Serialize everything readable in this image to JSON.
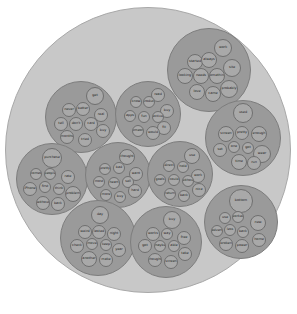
{
  "diagram": {
    "type": "circle-packing",
    "colors": {
      "background": "#ffffff",
      "outer": "#c8c8c8",
      "group": "#9a9a9a",
      "leaf": "#a9a9a9",
      "leaf_border": "#6f6f6f"
    },
    "outer": {
      "cx": 148,
      "cy": 150,
      "r": 143
    },
    "groups": [
      {
        "id": "g1",
        "cx": 209,
        "cy": 70,
        "r": 42,
        "leaves": [
          {
            "label": "work",
            "dx": 14,
            "dy": -22,
            "r": 9
          },
          {
            "label": "started",
            "dx": -14,
            "dy": -8,
            "r": 8
          },
          {
            "label": "always",
            "dx": 0,
            "dy": -10,
            "r": 8
          },
          {
            "label": "site",
            "dx": 23,
            "dy": -2,
            "r": 9
          },
          {
            "label": "looking",
            "dx": -24,
            "dy": 6,
            "r": 8
          },
          {
            "label": "needs",
            "dx": -8,
            "dy": 6,
            "r": 8
          },
          {
            "label": "something",
            "dx": 8,
            "dy": 6,
            "r": 8
          },
          {
            "label": "love",
            "dx": -12,
            "dy": 22,
            "r": 8
          },
          {
            "label": "came",
            "dx": 4,
            "dy": 24,
            "r": 8
          },
          {
            "label": "probably",
            "dx": 20,
            "dy": 19,
            "r": 9
          }
        ]
      },
      {
        "id": "g2",
        "cx": 81,
        "cy": 117,
        "r": 36,
        "leaves": [
          {
            "label": "get",
            "dx": 14,
            "dy": -21,
            "r": 9
          },
          {
            "label": "never",
            "dx": -12,
            "dy": -7,
            "r": 7
          },
          {
            "label": "better",
            "dx": 2,
            "dy": -8,
            "r": 7
          },
          {
            "label": "real",
            "dx": 20,
            "dy": -2,
            "r": 7
          },
          {
            "label": "tell",
            "dx": -20,
            "dy": 7,
            "r": 7
          },
          {
            "label": "don't",
            "dx": -5,
            "dy": 7,
            "r": 7
          },
          {
            "label": "card",
            "dx": 10,
            "dy": 7,
            "r": 7
          },
          {
            "label": "buy",
            "dx": 22,
            "dy": 14,
            "r": 7
          },
          {
            "label": "months",
            "dx": -14,
            "dy": 20,
            "r": 7
          },
          {
            "label": "tried",
            "dx": 4,
            "dy": 23,
            "r": 7
          }
        ]
      },
      {
        "id": "g3",
        "cx": 148,
        "cy": 114,
        "r": 33,
        "leaves": [
          {
            "label": "read",
            "dx": 10,
            "dy": -19,
            "r": 7
          },
          {
            "label": "know",
            "dx": -12,
            "dy": -12,
            "r": 6
          },
          {
            "label": "product",
            "dx": 1,
            "dy": -12,
            "r": 6
          },
          {
            "label": "buy",
            "dx": 19,
            "dy": -3,
            "r": 7
          },
          {
            "label": "apps",
            "dx": -18,
            "dy": 2,
            "r": 6
          },
          {
            "label": "fun",
            "dx": -4,
            "dy": 3,
            "r": 6
          },
          {
            "label": "active",
            "dx": 10,
            "dy": 3,
            "r": 6
          },
          {
            "label": "fit",
            "dx": 16,
            "dy": 14,
            "r": 7
          },
          {
            "label": "someone",
            "dx": -10,
            "dy": 17,
            "r": 6
          },
          {
            "label": "would",
            "dx": 5,
            "dy": 19,
            "r": 7
          }
        ]
      },
      {
        "id": "g4",
        "cx": 243,
        "cy": 138,
        "r": 38,
        "leaves": [
          {
            "label": "used",
            "dx": 0,
            "dy": -25,
            "r": 10
          },
          {
            "label": "screen",
            "dx": -17,
            "dy": -4,
            "r": 8
          },
          {
            "label": "pretty",
            "dx": -1,
            "dy": -5,
            "r": 7
          },
          {
            "label": "enough",
            "dx": 16,
            "dy": -4,
            "r": 8
          },
          {
            "label": "set",
            "dx": -23,
            "dy": 12,
            "r": 7
          },
          {
            "label": "one",
            "dx": -9,
            "dy": 9,
            "r": 6
          },
          {
            "label": "got",
            "dx": 5,
            "dy": 10,
            "r": 6
          },
          {
            "label": "wear",
            "dx": 19,
            "dy": 16,
            "r": 9
          },
          {
            "label": "time",
            "dx": -4,
            "dy": 24,
            "r": 8
          },
          {
            "label": "run",
            "dx": 11,
            "dy": 25,
            "r": 7
          }
        ]
      },
      {
        "id": "g5",
        "cx": 52,
        "cy": 179,
        "r": 36,
        "leaves": [
          {
            "label": "purchase",
            "dx": 0,
            "dy": -21,
            "r": 10
          },
          {
            "label": "comes",
            "dx": -16,
            "dy": -5,
            "r": 6
          },
          {
            "label": "people",
            "dx": -2,
            "dy": -5,
            "r": 6
          },
          {
            "label": "rate",
            "dx": 16,
            "dy": -2,
            "r": 7
          },
          {
            "label": "iPhone",
            "dx": -22,
            "dy": 10,
            "r": 7
          },
          {
            "label": "first",
            "dx": -7,
            "dy": 8,
            "r": 6
          },
          {
            "label": "think",
            "dx": 7,
            "dy": 10,
            "r": 6
          },
          {
            "label": "problem",
            "dx": 21,
            "dy": 15,
            "r": 8
          },
          {
            "label": "without",
            "dx": -9,
            "dy": 24,
            "r": 7
          },
          {
            "label": "back",
            "dx": 6,
            "dy": 25,
            "r": 7
          }
        ]
      },
      {
        "id": "g6",
        "cx": 118,
        "cy": 175,
        "r": 33,
        "leaves": [
          {
            "label": "thought",
            "dx": 9,
            "dy": -18,
            "r": 8
          },
          {
            "label": "pretty",
            "dx": -13,
            "dy": -6,
            "r": 6
          },
          {
            "label": "bad",
            "dx": 1,
            "dy": -7,
            "r": 6
          },
          {
            "label": "want",
            "dx": 18,
            "dy": -1,
            "r": 7
          },
          {
            "label": "most",
            "dx": -19,
            "dy": 7,
            "r": 6
          },
          {
            "label": "heart",
            "dx": -4,
            "dy": 8,
            "r": 6
          },
          {
            "label": "sell",
            "dx": 10,
            "dy": 7,
            "r": 6
          },
          {
            "label": "hard",
            "dx": 17,
            "dy": 16,
            "r": 7
          },
          {
            "label": "more",
            "dx": -12,
            "dy": 20,
            "r": 6
          },
          {
            "label": "buy",
            "dx": 2,
            "dy": 22,
            "r": 6
          }
        ]
      },
      {
        "id": "g7",
        "cx": 180,
        "cy": 174,
        "r": 33,
        "leaves": [
          {
            "label": "use",
            "dx": 12,
            "dy": -18,
            "r": 8
          },
          {
            "label": "direct",
            "dx": -11,
            "dy": -8,
            "r": 6
          },
          {
            "label": "hold",
            "dx": 3,
            "dy": -7,
            "r": 6
          },
          {
            "label": "work",
            "dx": 18,
            "dy": 2,
            "r": 7
          },
          {
            "label": "goals",
            "dx": -20,
            "dy": 6,
            "r": 6
          },
          {
            "label": "could",
            "dx": -6,
            "dy": 6,
            "r": 6
          },
          {
            "label": "without",
            "dx": 8,
            "dy": 7,
            "r": 6
          },
          {
            "label": "nice",
            "dx": 19,
            "dy": 16,
            "r": 7
          },
          {
            "label": "return",
            "dx": -10,
            "dy": 20,
            "r": 6
          },
          {
            "label": "back",
            "dx": 4,
            "dy": 22,
            "r": 6
          }
        ]
      },
      {
        "id": "g8",
        "cx": 241,
        "cy": 222,
        "r": 37,
        "leaves": [
          {
            "label": "bottom",
            "dx": 0,
            "dy": -21,
            "r": 12
          },
          {
            "label": "use",
            "dx": -16,
            "dy": -4,
            "r": 6
          },
          {
            "label": "worked",
            "dx": -3,
            "dy": -5,
            "r": 6
          },
          {
            "label": "new",
            "dx": 17,
            "dy": 1,
            "r": 8
          },
          {
            "label": "advert",
            "dx": -24,
            "dy": 9,
            "r": 6
          },
          {
            "label": "less",
            "dx": -11,
            "dy": 8,
            "r": 6
          },
          {
            "label": "back",
            "dx": 2,
            "dy": 10,
            "r": 6
          },
          {
            "label": "home",
            "dx": 18,
            "dy": 18,
            "r": 7
          },
          {
            "label": "broken",
            "dx": -15,
            "dy": 22,
            "r": 7
          },
          {
            "label": "power",
            "dx": 1,
            "dy": 24,
            "r": 7
          }
        ]
      },
      {
        "id": "g9",
        "cx": 98,
        "cy": 238,
        "r": 38,
        "leaves": [
          {
            "label": "day",
            "dx": 2,
            "dy": -23,
            "r": 9
          },
          {
            "label": "weird",
            "dx": -13,
            "dy": -6,
            "r": 7
          },
          {
            "label": "lasted",
            "dx": 1,
            "dy": -6,
            "r": 7
          },
          {
            "label": "night",
            "dx": 16,
            "dy": -4,
            "r": 7
          },
          {
            "label": "check",
            "dx": -21,
            "dy": 8,
            "r": 7
          },
          {
            "label": "move",
            "dx": -6,
            "dy": 6,
            "r": 6
          },
          {
            "label": "keep",
            "dx": 8,
            "dy": 7,
            "r": 6
          },
          {
            "label": "year",
            "dx": 21,
            "dy": 12,
            "r": 7
          },
          {
            "label": "another",
            "dx": -9,
            "dy": 21,
            "r": 8
          },
          {
            "label": "make",
            "dx": 8,
            "dy": 22,
            "r": 7
          }
        ]
      },
      {
        "id": "g10",
        "cx": 166,
        "cy": 242,
        "r": 36,
        "leaves": [
          {
            "label": "buy",
            "dx": 6,
            "dy": -22,
            "r": 9
          },
          {
            "label": "works",
            "dx": -13,
            "dy": -8,
            "r": 7
          },
          {
            "label": "way",
            "dx": 1,
            "dy": -8,
            "r": 6
          },
          {
            "label": "free",
            "dx": 18,
            "dy": -4,
            "r": 7
          },
          {
            "label": "got",
            "dx": -21,
            "dy": 4,
            "r": 7
          },
          {
            "label": "maybe",
            "dx": -6,
            "dy": 4,
            "r": 6
          },
          {
            "label": "able",
            "dx": 8,
            "dy": 4,
            "r": 6
          },
          {
            "label": "take",
            "dx": 19,
            "dy": 12,
            "r": 7
          },
          {
            "label": "thought",
            "dx": -11,
            "dy": 18,
            "r": 7
          },
          {
            "label": "screen",
            "dx": 5,
            "dy": 20,
            "r": 7
          }
        ]
      }
    ]
  }
}
